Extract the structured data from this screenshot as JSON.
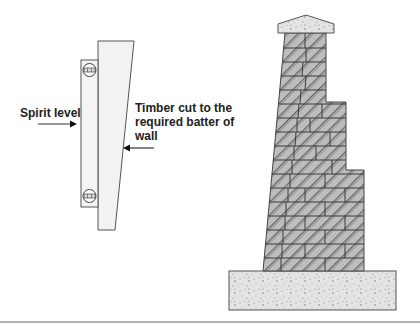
{
  "diagram": {
    "labels": {
      "spirit_level": "Spirit level",
      "timber_line1": "Timber cut to the",
      "timber_line2": "required batter of",
      "timber_line3": "wall"
    },
    "colors": {
      "outline": "#555555",
      "timber_fill": "#f2f2f2",
      "level_fill": "#f4f4f4",
      "brick_fill": "#bdbdbd",
      "hatch": "#333333",
      "concrete_fill": "#e6e6e6",
      "rule": "#999999",
      "text": "#222222"
    },
    "components": [
      "spirit-level",
      "batter-timber",
      "battered-brick-wall",
      "coping-stone",
      "concrete-foundation"
    ]
  }
}
